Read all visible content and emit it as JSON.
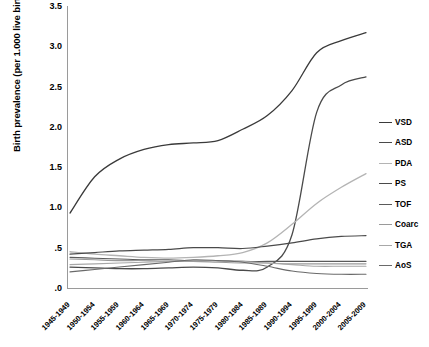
{
  "chart_data": {
    "type": "line",
    "title": "",
    "xlabel": "",
    "ylabel": "Birth prevalence (per 1.000 live births)",
    "ylim": [
      0,
      3.5
    ],
    "ytick_labels": [
      "3.5",
      "3.0",
      "2.5",
      "2.0",
      "1.5",
      "1.0",
      ".5",
      ".0"
    ],
    "ytick_values": [
      3.5,
      3.0,
      2.5,
      2.0,
      1.5,
      1.0,
      0.5,
      0.0
    ],
    "grid": false,
    "legend_position": "right",
    "categories": [
      "1945-1949",
      "1950-1954",
      "1955-1959",
      "1960-1964",
      "1965-1969",
      "1970-1974",
      "1975-1979",
      "1980-1984",
      "1985-1989",
      "1990-1994",
      "1995-1999",
      "2000-2004",
      "2005-2009"
    ],
    "series": [
      {
        "name": "VSD",
        "color": "#3a3a3a",
        "width": 1.3,
        "values": [
          0.93,
          1.38,
          1.6,
          1.72,
          1.78,
          1.8,
          1.83,
          1.97,
          2.14,
          2.45,
          2.92,
          3.07,
          3.17
        ]
      },
      {
        "name": "ASD",
        "color": "#4a4a4a",
        "width": 1.3,
        "values": [
          0.26,
          0.25,
          0.24,
          0.24,
          0.25,
          0.26,
          0.25,
          0.22,
          0.26,
          0.66,
          2.18,
          2.52,
          2.62
        ]
      },
      {
        "name": "PDA",
        "color": "#b4b4b4",
        "width": 1.3,
        "values": [
          0.45,
          0.42,
          0.4,
          0.38,
          0.37,
          0.38,
          0.4,
          0.44,
          0.56,
          0.79,
          1.05,
          1.25,
          1.42
        ]
      },
      {
        "name": "PS",
        "color": "#4a4a4a",
        "width": 1.2,
        "values": [
          0.42,
          0.44,
          0.46,
          0.47,
          0.48,
          0.5,
          0.5,
          0.49,
          0.52,
          0.56,
          0.61,
          0.64,
          0.65
        ]
      },
      {
        "name": "TOF",
        "color": "#5a5a5a",
        "width": 1.1,
        "values": [
          0.38,
          0.37,
          0.36,
          0.35,
          0.35,
          0.34,
          0.34,
          0.33,
          0.33,
          0.33,
          0.33,
          0.33,
          0.33
        ]
      },
      {
        "name": "Coarc",
        "color": "#9a9a9a",
        "width": 1.1,
        "values": [
          0.36,
          0.35,
          0.34,
          0.34,
          0.33,
          0.33,
          0.32,
          0.31,
          0.31,
          0.3,
          0.3,
          0.3,
          0.3
        ]
      },
      {
        "name": "TGA",
        "color": "#a8a8a8",
        "width": 1.1,
        "values": [
          0.29,
          0.3,
          0.31,
          0.32,
          0.33,
          0.34,
          0.34,
          0.33,
          0.31,
          0.29,
          0.27,
          0.27,
          0.27
        ]
      },
      {
        "name": "AoS",
        "color": "#6a6a6a",
        "width": 1.1,
        "values": [
          0.2,
          0.23,
          0.26,
          0.29,
          0.32,
          0.35,
          0.34,
          0.32,
          0.27,
          0.21,
          0.18,
          0.17,
          0.17
        ]
      }
    ]
  }
}
